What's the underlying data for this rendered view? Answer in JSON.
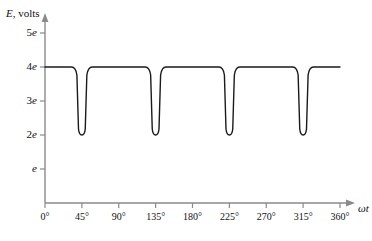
{
  "chart_data": {
    "type": "line",
    "title": "",
    "subtitle": "",
    "xlabel": "ωt",
    "ylabel": "E, volts",
    "ylabel_parts": {
      "symbol": "E",
      "rest": ", volts"
    },
    "xlim": [
      0,
      360
    ],
    "ylim": [
      0,
      5.45
    ],
    "grid": false,
    "legend": null,
    "x_unit": "degrees",
    "y_unit": "e",
    "xticks": [
      0,
      45,
      90,
      135,
      180,
      225,
      270,
      315,
      360
    ],
    "xtick_labels": [
      "0°",
      "45°",
      "90°",
      "135°",
      "180°",
      "225°",
      "270°",
      "315°",
      "360°"
    ],
    "yticks": [
      1,
      2,
      3,
      4,
      5
    ],
    "ytick_labels": [
      "e",
      "2e",
      "3e",
      "4e",
      "5e"
    ],
    "ytick_label_parts": [
      {
        "coef": "",
        "symbol": "e"
      },
      {
        "coef": "2",
        "symbol": "e"
      },
      {
        "coef": "3",
        "symbol": "e"
      },
      {
        "coef": "4",
        "symbol": "e"
      },
      {
        "coef": "5",
        "symbol": "e"
      }
    ],
    "high_level": 4,
    "low_level": 2,
    "notch_centers_deg": [
      45,
      135,
      225,
      315
    ],
    "notch_half_width_deg": 9,
    "series": [
      {
        "name": "E",
        "color": "#1a1a1a",
        "linewidth": 1.4,
        "x": [
          0,
          34,
          38,
          41,
          44,
          46,
          49,
          52,
          56,
          124,
          128,
          131,
          134,
          136,
          139,
          142,
          146,
          214,
          218,
          221,
          224,
          226,
          229,
          232,
          236,
          304,
          308,
          311,
          314,
          316,
          319,
          322,
          326,
          360
        ],
        "values": [
          4,
          4,
          3.9,
          3.3,
          2.35,
          2.05,
          2,
          2.1,
          2.85,
          4,
          4,
          3.9,
          3.3,
          2.35,
          2.05,
          2,
          2.1,
          2.85,
          4,
          4,
          3.9,
          3.3,
          2.35,
          2.05,
          2,
          2.1,
          2.85,
          4,
          4,
          3.9,
          3.3,
          2.35,
          2.05,
          4
        ]
      }
    ],
    "axis_color": "#8a8a8a",
    "trace_color": "#1a1a1a"
  },
  "figure": {
    "axis_arrow_x": "ωt",
    "axis_arrow_y": ""
  }
}
